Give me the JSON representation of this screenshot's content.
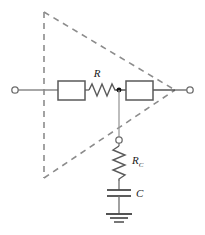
{
  "diagram": {
    "type": "electronic-schematic",
    "width": 205,
    "height": 235,
    "colors": {
      "wire": "#6e6e6e",
      "component_outline": "#5a5a5a",
      "dashed_boundary": "#8c8c8c",
      "node_dot": "#111111",
      "label_text": "#1a1a1a",
      "background": "#ffffff"
    },
    "labels": {
      "resistor_series": "R",
      "resistor_c_base": "R",
      "resistor_c_subscript": "C",
      "capacitor": "C"
    },
    "geometry": {
      "signal_line_y": 90,
      "input_terminal": {
        "cx": 15,
        "cy": 90,
        "r": 3.2
      },
      "output_terminal": {
        "cx": 190,
        "cy": 90,
        "r": 3.2
      },
      "node_terminal": {
        "cx": 119,
        "cy": 140,
        "r": 3.2
      },
      "junction_dot": {
        "cx": 119,
        "cy": 90,
        "r": 2.4
      },
      "triangle": {
        "left_x": 44,
        "top_y": 12,
        "bottom_y": 178,
        "apex_x": 175,
        "apex_y": 90
      },
      "block_left": {
        "x": 58,
        "y": 81,
        "w": 27,
        "h": 19
      },
      "block_right": {
        "x": 126,
        "y": 81,
        "w": 27,
        "h": 19
      },
      "resistor_series_span": {
        "x1": 88,
        "x2": 117,
        "y": 90
      },
      "resistor_c_span": {
        "y1": 146,
        "y2": 181,
        "x": 119
      },
      "capacitor_plates": {
        "x1": 107,
        "x2": 131,
        "y_top": 190,
        "y_bottom": 196
      },
      "ground_bars": [
        {
          "x1": 106,
          "x2": 132,
          "y": 214
        },
        {
          "x1": 110,
          "x2": 128,
          "y": 218
        },
        {
          "x1": 114,
          "x2": 124,
          "y": 222
        }
      ]
    }
  }
}
